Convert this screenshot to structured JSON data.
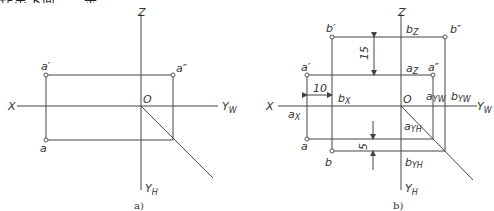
{
  "header": {
    "clipped_text": "作出下面……示"
  },
  "diagram_a": {
    "caption": "a)",
    "axes": {
      "x": "X",
      "z": "Z",
      "yw": "Y",
      "yw_sub": "W",
      "yh": "Y",
      "yh_sub": "H",
      "origin": "O"
    },
    "points": {
      "a_front": "a′",
      "a_side": "a″",
      "a_top": "a"
    }
  },
  "diagram_b": {
    "caption": "b)",
    "axes": {
      "x": "X",
      "z": "Z",
      "yw": "Y",
      "yw_sub": "W",
      "yh": "Y",
      "yh_sub": "H",
      "origin": "O"
    },
    "points": {
      "b_front": "b′",
      "b_side": "b″",
      "b_top": "b",
      "a_front": "a′",
      "a_side": "a″",
      "a_top": "a"
    },
    "markers": {
      "bz": "b",
      "bz_sub": "Z",
      "az": "a",
      "az_sub": "Z",
      "bx": "b",
      "bx_sub": "X",
      "ax": "a",
      "ax_sub": "X",
      "ayw": "a",
      "ayw_sub": "YW",
      "byw": "b",
      "byw_sub": "YW",
      "ayh": "a",
      "ayh_sub": "YH",
      "byh": "b",
      "byh_sub": "YH"
    },
    "dimensions": {
      "height_diff": "15",
      "x_diff": "10",
      "y_diff": "5"
    }
  }
}
